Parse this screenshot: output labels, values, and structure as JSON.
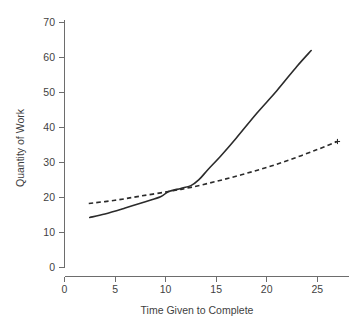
{
  "chart_data": {
    "type": "line",
    "title": "",
    "xlabel": "Time Given to Complete",
    "ylabel": "Quantity of Work",
    "xlim": [
      0,
      28.5
    ],
    "ylim": [
      0,
      70
    ],
    "xticks": [
      0,
      5,
      10,
      15,
      20,
      25
    ],
    "yticks": [
      0,
      10,
      20,
      30,
      40,
      50,
      60,
      70
    ],
    "xtick_labels": [
      "0",
      "5",
      "10",
      "15",
      "20",
      "25"
    ],
    "ytick_labels": [
      "0",
      "10",
      "20",
      "30",
      "40",
      "50",
      "60",
      "70"
    ],
    "grid": false,
    "legend": null,
    "background": "#ffffff",
    "line_color": "#2b2b2b",
    "axis_color": "#6d6d6d",
    "series": [
      {
        "name": "solid-curve",
        "style": "solid",
        "x": [
          2.5,
          4.0,
          6.0,
          8.0,
          9.5,
          10.3,
          11.5,
          12.5,
          13.3,
          14.2,
          15.5,
          17.0,
          19.0,
          21.0,
          23.0,
          24.4
        ],
        "values": [
          14.3,
          15.3,
          17.0,
          18.8,
          20.2,
          21.7,
          22.6,
          23.4,
          25.1,
          28.0,
          32.0,
          37.0,
          44.0,
          50.5,
          57.5,
          62.0
        ]
      },
      {
        "name": "dashed-curve",
        "style": "dashed",
        "x": [
          2.4,
          5.0,
          7.5,
          10.3,
          12.5,
          15.0,
          17.5,
          20.0,
          22.5,
          25.0,
          27.0
        ],
        "values": [
          18.3,
          19.2,
          20.4,
          21.7,
          22.9,
          24.6,
          26.5,
          28.6,
          31.0,
          33.7,
          36.0
        ]
      }
    ],
    "annotations": [
      {
        "name": "dashed-end-marker",
        "shape": "plus",
        "x": 27.0,
        "y": 36.0
      }
    ]
  }
}
